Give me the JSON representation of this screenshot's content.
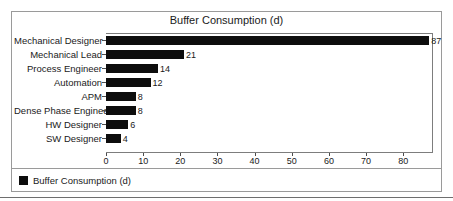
{
  "chart_data": {
    "type": "bar",
    "orientation": "horizontal",
    "title": "Buffer Consumption (d)",
    "xlabel": "",
    "ylabel": "",
    "categories": [
      "Mechanical Designer",
      "Mechanical Lead",
      "Process Engineer",
      "Automation",
      "APM",
      "Dense Phase Engineer",
      "HW Designer",
      "SW Designer"
    ],
    "values": [
      87,
      21,
      14,
      12,
      8,
      8,
      6,
      4
    ],
    "data_labels": [
      "87",
      "21",
      "14",
      "12",
      "8",
      "8",
      "6",
      "4"
    ],
    "xlim": [
      0,
      88
    ],
    "xticks": [
      0,
      10,
      20,
      30,
      40,
      50,
      60,
      70,
      80
    ],
    "xtick_labels": [
      "0",
      "10",
      "20",
      "30",
      "40",
      "50",
      "60",
      "70",
      "80"
    ],
    "grid": false,
    "legend_position": "bottom",
    "series": [
      {
        "name": "Buffer Consumption (d)",
        "color": "#0d0d0d",
        "values": [
          87,
          21,
          14,
          12,
          8,
          8,
          6,
          4
        ]
      }
    ]
  },
  "legend": {
    "entries": [
      {
        "label": "Buffer Consumption (d)",
        "color": "#0d0d0d"
      }
    ]
  },
  "colors": {
    "bar": "#0d0d0d",
    "frame": "#9a9a9a",
    "axis": "#7d7d7d",
    "text": "#1a1a1a",
    "background": "#ffffff"
  }
}
